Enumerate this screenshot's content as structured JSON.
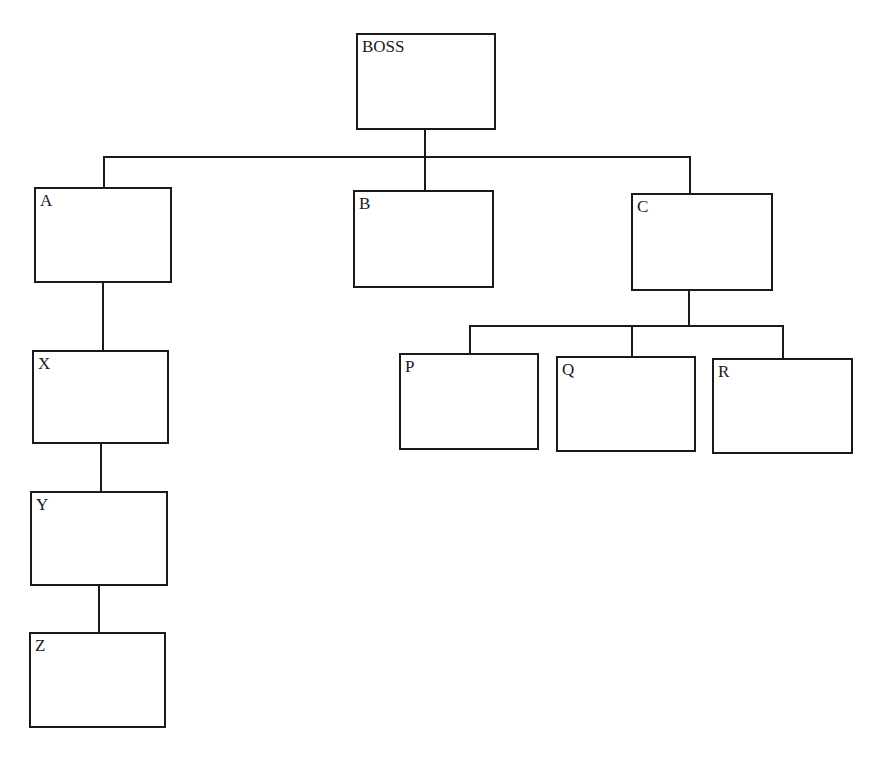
{
  "chart_title": "",
  "nodes": {
    "boss": {
      "label": "BOSS"
    },
    "a": {
      "label": "A"
    },
    "b": {
      "label": "B"
    },
    "c": {
      "label": "C"
    },
    "x": {
      "label": "X"
    },
    "y": {
      "label": "Y"
    },
    "z": {
      "label": "Z"
    },
    "p": {
      "label": "P"
    },
    "q": {
      "label": "Q"
    },
    "r": {
      "label": "R"
    }
  },
  "edges": [
    [
      "BOSS",
      "A"
    ],
    [
      "BOSS",
      "B"
    ],
    [
      "BOSS",
      "C"
    ],
    [
      "A",
      "X"
    ],
    [
      "X",
      "Y"
    ],
    [
      "Y",
      "Z"
    ],
    [
      "C",
      "P"
    ],
    [
      "C",
      "Q"
    ],
    [
      "C",
      "R"
    ]
  ],
  "colors": {
    "stroke": "#1a1a1a",
    "background": "#ffffff"
  }
}
